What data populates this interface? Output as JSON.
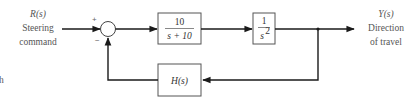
{
  "input": {
    "symbol": "R(s)",
    "line1": "Steering",
    "line2": "command"
  },
  "output": {
    "symbol": "Y(s)",
    "line1": "Direction",
    "line2": "of travel"
  },
  "summing_junction": {
    "plus_sign": "+",
    "minus_sign": "−"
  },
  "blocks": {
    "controller": {
      "numerator": "10",
      "denominator": "s + 10"
    },
    "plant": {
      "numerator": "1",
      "denominator_base": "s",
      "denominator_exp": "2"
    },
    "feedback": {
      "label": "H(s)"
    }
  },
  "edge_mark": "h",
  "colors": {
    "line": "#1a1a1a",
    "box": "#555555",
    "label": "#555555"
  }
}
